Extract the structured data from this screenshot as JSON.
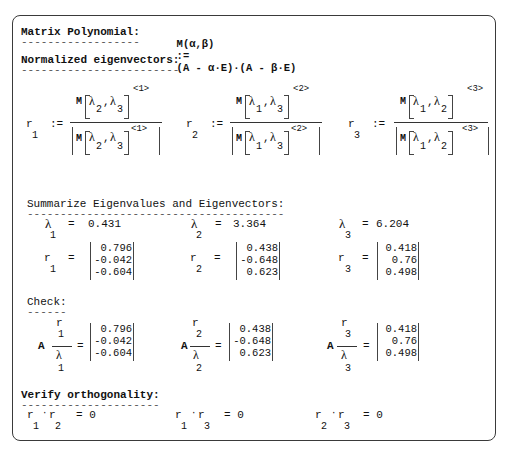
{
  "header": {
    "label": "Matrix Polynomial:",
    "underline": "------------------",
    "formula_lhs": "M(α,β)",
    "assign": ":=",
    "formula_rhs": "(A - α·E)·(A - β·E)"
  },
  "normalized": {
    "title": "Normalized eigenvectors:",
    "underline": "------------------------",
    "items": [
      {
        "var": "r",
        "idx": "1",
        "assign": ":=",
        "M": "M",
        "l1": "λ",
        "i1": "2",
        "comma": ",",
        "l2": "λ",
        "i2": "3",
        "col": "<1>"
      },
      {
        "var": "r",
        "idx": "2",
        "assign": ":=",
        "M": "M",
        "l1": "λ",
        "i1": "1",
        "comma": ",",
        "l2": "λ",
        "i2": "3",
        "col": "<2>"
      },
      {
        "var": "r",
        "idx": "3",
        "assign": ":=",
        "M": "M",
        "l1": "λ",
        "i1": "1",
        "comma": ",",
        "l2": "λ",
        "i2": "2",
        "col": "<3>"
      }
    ]
  },
  "summary": {
    "title": "Summarize Eigenvalues and Eigenvectors:",
    "underline": "---------------------------------------",
    "eigenvalues": [
      {
        "sym": "λ",
        "idx": "1",
        "eq": "=",
        "value": "0.431"
      },
      {
        "sym": "λ",
        "idx": "2",
        "eq": "=",
        "value": "3.364"
      },
      {
        "sym": "λ",
        "idx": "3",
        "eq": "=",
        "value": "6.204"
      }
    ],
    "eigenvectors": [
      {
        "sym": "r",
        "idx": "1",
        "eq": "=",
        "values": [
          "0.796",
          "-0.042",
          "-0.604"
        ]
      },
      {
        "sym": "r",
        "idx": "2",
        "eq": "=",
        "values": [
          "0.438",
          "-0.648",
          "0.623"
        ]
      },
      {
        "sym": "r",
        "idx": "3",
        "eq": "=",
        "values": [
          "0.418",
          "0.76",
          "0.498"
        ]
      }
    ]
  },
  "check": {
    "title": "Check:",
    "underline": "------",
    "items": [
      {
        "A": "A",
        "num": "r",
        "num_idx": "1",
        "den": "λ",
        "den_idx": "1",
        "eq": "=",
        "values": [
          "0.796",
          "-0.042",
          "-0.604"
        ]
      },
      {
        "A": "A",
        "num": "r",
        "num_idx": "2",
        "den": "λ",
        "den_idx": "2",
        "eq": "=",
        "values": [
          "0.438",
          "-0.648",
          "0.623"
        ]
      },
      {
        "A": "A",
        "num": "r",
        "num_idx": "3",
        "den": "λ",
        "den_idx": "3",
        "eq": "=",
        "values": [
          "0.418",
          "0.76",
          "0.498"
        ]
      }
    ]
  },
  "orthogonality": {
    "title": "Verify orthogonality:",
    "underline": "---------------------",
    "items": [
      {
        "a": "r",
        "ai": "1",
        "dot": "·",
        "b": "r",
        "bi": "2",
        "result": "= 0"
      },
      {
        "a": "r",
        "ai": "1",
        "dot": "·",
        "b": "r",
        "bi": "3",
        "result": "= 0"
      },
      {
        "a": "r",
        "ai": "2",
        "dot": "·",
        "b": "r",
        "bi": "3",
        "result": "= 0"
      }
    ]
  }
}
